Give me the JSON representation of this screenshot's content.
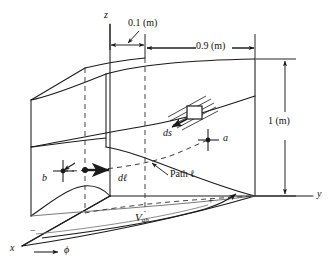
{
  "figure": {
    "axes": {
      "z_label": "z",
      "y_label": "y",
      "x_label": "x",
      "phi_label": "ϕ"
    },
    "dimensions": {
      "inner_gap": "0.1 (m)",
      "outer_span": "0.9 (m)",
      "height": "1 (m)"
    },
    "annotations": {
      "point_a": "a",
      "point_b": "b",
      "path": "Path ℓ",
      "dl": "dℓ⃗",
      "dl_text": "dl",
      "ds": "ds",
      "voltage": "V",
      "voltage_sub": "ab",
      "plus_sign": "+",
      "minus_sign": "−"
    },
    "colors": {
      "ink": "#1a1a1a",
      "dash": "#3a3a3a",
      "background": "#ffffff"
    }
  }
}
